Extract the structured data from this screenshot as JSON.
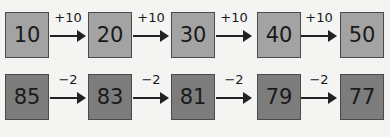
{
  "sequences": [
    {
      "name": "increasing",
      "values": [
        "10",
        "20",
        "30",
        "40",
        "50"
      ],
      "steps": [
        "+10",
        "+10",
        "+10",
        "+10"
      ],
      "box_color": "#a3a3a3"
    },
    {
      "name": "decreasing",
      "values": [
        "85",
        "83",
        "81",
        "79",
        "77"
      ],
      "steps": [
        "−2",
        "−2",
        "−2",
        "−2"
      ],
      "box_color": "#7c7c7c"
    }
  ]
}
